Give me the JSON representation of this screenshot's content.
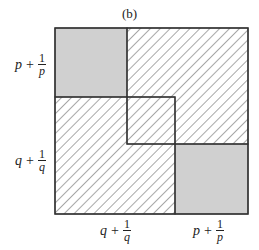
{
  "caption": "(b)",
  "labels": {
    "left_top": {
      "var": "p",
      "plus": "+",
      "num": "1",
      "den": "p"
    },
    "left_bottom": {
      "var": "q",
      "plus": "+",
      "num": "1",
      "den": "q"
    },
    "bottom_left": {
      "var": "q",
      "plus": "+",
      "num": "1",
      "den": "q"
    },
    "bottom_right": {
      "var": "p",
      "plus": "+",
      "num": "1",
      "den": "p"
    }
  },
  "colors": {
    "shaded": "#d0d0d0",
    "hatch": "#a8a8a8",
    "stroke": "#333333"
  }
}
